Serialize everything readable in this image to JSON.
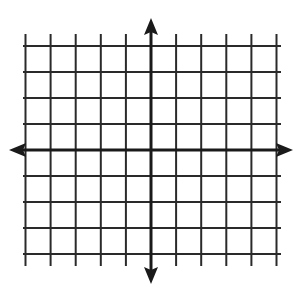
{
  "diagram": {
    "type": "coordinate-plane",
    "x_range": [
      -5,
      5
    ],
    "y_range": [
      -4,
      4
    ],
    "grid": {
      "columns": 10,
      "rows": 8,
      "origin_px": [
        151,
        150
      ],
      "x_step_px": 25.1,
      "y_step_px": 26,
      "vertical_line_top_px": 34,
      "vertical_line_bottom_px": 266,
      "horizontal_line_left_px": 23,
      "horizontal_line_right_px": 281
    },
    "axes": {
      "x_axis": {
        "left_tip_px": 9,
        "right_tip_px": 293,
        "arrows": "both"
      },
      "y_axis": {
        "top_tip_px": 18,
        "bottom_tip_px": 284,
        "arrows": "both"
      }
    },
    "labels": [],
    "colors": {
      "background": "#ffffff",
      "grid": "#2a2a2a",
      "axis": "#1a1a1a"
    }
  }
}
